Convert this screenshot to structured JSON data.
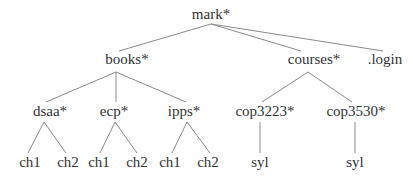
{
  "diagram": {
    "type": "directory-tree",
    "colors": {
      "text": "#333333",
      "edge": "#8a8a8a",
      "background": "#ffffff"
    },
    "nodes": {
      "mark": {
        "label": "mark*",
        "x": 211,
        "y": 19
      },
      "books": {
        "label": "books*",
        "x": 127,
        "y": 64
      },
      "courses": {
        "label": "courses*",
        "x": 314,
        "y": 64
      },
      "login": {
        "label": ".login",
        "x": 385,
        "y": 64
      },
      "dsaa": {
        "label": "dsaa*",
        "x": 50,
        "y": 116
      },
      "ecp": {
        "label": "ecp*",
        "x": 114,
        "y": 116
      },
      "ipps": {
        "label": "ipps*",
        "x": 184,
        "y": 116
      },
      "cop3223": {
        "label": "cop3223*",
        "x": 265,
        "y": 116
      },
      "cop3530": {
        "label": "cop3530*",
        "x": 356,
        "y": 116
      },
      "dsaa_ch1": {
        "label": "ch1",
        "x": 30,
        "y": 167
      },
      "dsaa_ch2": {
        "label": "ch2",
        "x": 68,
        "y": 167
      },
      "ecp_ch1": {
        "label": "ch1",
        "x": 99,
        "y": 167
      },
      "ecp_ch2": {
        "label": "ch2",
        "x": 137,
        "y": 167
      },
      "ipps_ch1": {
        "label": "ch1",
        "x": 170,
        "y": 167
      },
      "ipps_ch2": {
        "label": "ch2",
        "x": 208,
        "y": 167
      },
      "cop3223_syl": {
        "label": "syl",
        "x": 260,
        "y": 167
      },
      "cop3530_syl": {
        "label": "syl",
        "x": 355,
        "y": 167
      }
    },
    "edges": [
      {
        "from": "mark",
        "to": "books",
        "x1": 211,
        "y1": 24,
        "x2": 119,
        "y2": 51
      },
      {
        "from": "mark",
        "to": "courses",
        "x1": 211,
        "y1": 24,
        "x2": 301,
        "y2": 51
      },
      {
        "from": "mark",
        "to": "login",
        "x1": 211,
        "y1": 24,
        "x2": 383,
        "y2": 51
      },
      {
        "from": "books",
        "to": "dsaa",
        "x1": 116,
        "y1": 72,
        "x2": 46,
        "y2": 102
      },
      {
        "from": "books",
        "to": "ecp",
        "x1": 116,
        "y1": 72,
        "x2": 116,
        "y2": 102
      },
      {
        "from": "books",
        "to": "ipps",
        "x1": 116,
        "y1": 72,
        "x2": 186,
        "y2": 102
      },
      {
        "from": "courses",
        "to": "cop3223",
        "x1": 308,
        "y1": 72,
        "x2": 262,
        "y2": 102
      },
      {
        "from": "courses",
        "to": "cop3530",
        "x1": 308,
        "y1": 72,
        "x2": 352,
        "y2": 102
      },
      {
        "from": "dsaa",
        "to": "dsaa_ch1",
        "x1": 44,
        "y1": 122,
        "x2": 28,
        "y2": 153
      },
      {
        "from": "dsaa",
        "to": "dsaa_ch2",
        "x1": 44,
        "y1": 122,
        "x2": 66,
        "y2": 153
      },
      {
        "from": "ecp",
        "to": "ecp_ch1",
        "x1": 115,
        "y1": 122,
        "x2": 100,
        "y2": 153
      },
      {
        "from": "ecp",
        "to": "ecp_ch2",
        "x1": 115,
        "y1": 122,
        "x2": 137,
        "y2": 153
      },
      {
        "from": "ipps",
        "to": "ipps_ch1",
        "x1": 187,
        "y1": 122,
        "x2": 172,
        "y2": 153
      },
      {
        "from": "ipps",
        "to": "ipps_ch2",
        "x1": 187,
        "y1": 122,
        "x2": 210,
        "y2": 153
      },
      {
        "from": "cop3223",
        "to": "cop3223_syl",
        "x1": 260,
        "y1": 122,
        "x2": 260,
        "y2": 153
      },
      {
        "from": "cop3530",
        "to": "cop3530_syl",
        "x1": 355,
        "y1": 122,
        "x2": 355,
        "y2": 153
      }
    ]
  }
}
